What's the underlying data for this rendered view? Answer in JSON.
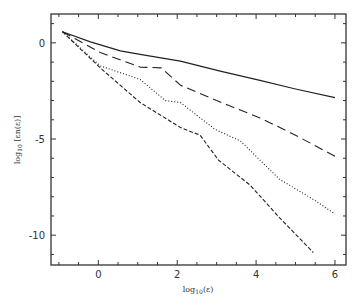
{
  "chart_data": {
    "type": "line",
    "title": "",
    "xlabel": "log10(ε)",
    "ylabel": "log10 [εn(ε)]",
    "xlim": [
      -1.2,
      6.28
    ],
    "ylim": [
      -11.55,
      1.5
    ],
    "xticks": [
      0,
      2,
      4,
      6
    ],
    "xtick_labels": [
      "0",
      "2",
      "4",
      "6"
    ],
    "yticks": [
      0,
      -5,
      -10
    ],
    "ytick_labels": [
      "0",
      "-5",
      "-10"
    ],
    "grid": false,
    "legend": null,
    "series": [
      {
        "name": "solid",
        "style": "solid",
        "x": [
          -0.91,
          -0.2,
          0.56,
          1.06,
          2.08,
          3.09,
          4.1,
          5.0,
          6.0
        ],
        "y": [
          0.58,
          0.05,
          -0.42,
          -0.6,
          -0.95,
          -1.47,
          -1.95,
          -2.4,
          -2.85
        ]
      },
      {
        "name": "long-dash",
        "style": "long-dash",
        "x": [
          -0.91,
          0.05,
          1.06,
          1.6,
          2.08,
          3.0,
          4.1,
          5.0,
          6.0
        ],
        "y": [
          0.58,
          -0.5,
          -1.26,
          -1.3,
          -2.2,
          -3.0,
          -3.9,
          -4.8,
          -5.9
        ]
      },
      {
        "name": "dotted",
        "style": "dotted",
        "x": [
          -0.91,
          0.05,
          1.06,
          1.7,
          2.08,
          2.96,
          3.6,
          4.6,
          5.5,
          6.0
        ],
        "y": [
          0.58,
          -1.2,
          -1.9,
          -3.0,
          -3.1,
          -4.5,
          -5.1,
          -7.1,
          -8.2,
          -8.9
        ]
      },
      {
        "name": "short-dash",
        "style": "short-dash",
        "x": [
          -0.91,
          0.05,
          1.06,
          2.08,
          2.58,
          3.05,
          3.85,
          4.6,
          5.45
        ],
        "y": [
          0.58,
          -1.3,
          -3.1,
          -4.4,
          -4.8,
          -6.1,
          -7.4,
          -9.1,
          -10.9
        ]
      }
    ]
  },
  "axes": {
    "xlabel_main": "log",
    "xlabel_sub": "10",
    "xlabel_arg": "(ε)",
    "ylabel_main": "log",
    "ylabel_sub": "10",
    "ylabel_arg": " [εn(ε)]"
  }
}
